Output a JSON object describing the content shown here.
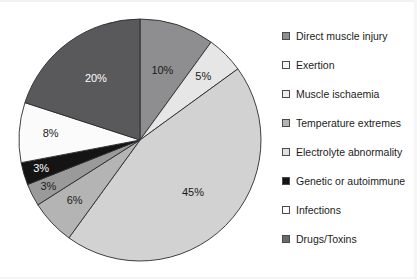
{
  "chart_data": {
    "type": "pie",
    "title": "",
    "subtitle": "",
    "xlabel": "",
    "ylabel": "",
    "legend_position": "right",
    "grid": false,
    "start_angle_deg": 0,
    "direction": "clockwise",
    "categories": [
      "Direct muscle injury",
      "Exertion",
      "Muscle ischaemia",
      "Temperature extremes",
      "Electrolyte abnormality",
      "Genetic or autoimmune",
      "Infections",
      "Drugs/Toxins"
    ],
    "values": [
      10,
      5,
      45,
      6,
      3,
      3,
      8,
      20
    ],
    "data_labels": [
      "10%",
      "5%",
      "45%",
      "6%",
      "3%",
      "3%",
      "8%",
      "20%"
    ],
    "colors": [
      "#8e8e90",
      "#e6e6e6",
      "#d2d2d2",
      "#b4b4b4",
      "#9a9a9a",
      "#141414",
      "#fbfbfb",
      "#59595b"
    ],
    "label_text_colors": [
      "#1a1a1a",
      "#1a1a1a",
      "#1a1a1a",
      "#1a1a1a",
      "#1a1a1a",
      "#ffffff",
      "#1a1a1a",
      "#ffffff"
    ],
    "slices": [
      {
        "label": "Direct muscle injury",
        "value": 10,
        "data_label": "10%",
        "color": "#8e8e90",
        "label_color": "#1a1a1a"
      },
      {
        "label": "Exertion",
        "value": 5,
        "data_label": "5%",
        "color": "#e6e6e6",
        "label_color": "#1a1a1a"
      },
      {
        "label": "Muscle ischaemia",
        "value": 45,
        "data_label": "45%",
        "color": "#d2d2d2",
        "label_color": "#1a1a1a"
      },
      {
        "label": "Temperature extremes",
        "value": 6,
        "data_label": "6%",
        "color": "#b4b4b4",
        "label_color": "#1a1a1a"
      },
      {
        "label": "Electrolyte abnormality",
        "value": 3,
        "data_label": "3%",
        "color": "#9a9a9a",
        "label_color": "#1a1a1a"
      },
      {
        "label": "Genetic or autoimmune",
        "value": 3,
        "data_label": "3%",
        "color": "#141414",
        "label_color": "#ffffff"
      },
      {
        "label": "Infections",
        "value": 8,
        "data_label": "8%",
        "color": "#fbfbfb",
        "label_color": "#1a1a1a"
      },
      {
        "label": "Drugs/Toxins",
        "value": 20,
        "data_label": "20%",
        "color": "#59595b",
        "label_color": "#ffffff"
      }
    ]
  },
  "legend": {
    "items": [
      {
        "label": "Direct muscle injury",
        "color": "#8e8e90"
      },
      {
        "label": "Exertion",
        "color": "#f4f4f4"
      },
      {
        "label": "Muscle ischaemia",
        "color": "#ededed"
      },
      {
        "label": "Temperature extremes",
        "color": "#b4b4b4"
      },
      {
        "label": "Electrolyte abnormality",
        "color": "#e0e0e0"
      },
      {
        "label": "Genetic or autoimmune",
        "color": "#141414"
      },
      {
        "label": "Infections",
        "color": "#fdfdfd"
      },
      {
        "label": "Drugs/Toxins",
        "color": "#6b6b6d"
      }
    ]
  }
}
